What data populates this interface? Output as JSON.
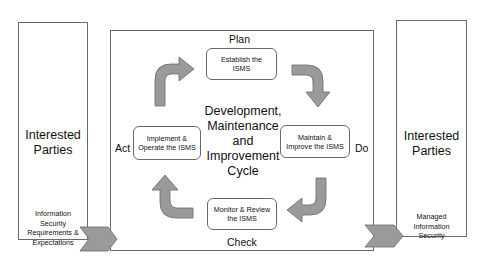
{
  "diagram": {
    "type": "cycle",
    "title": "Development, Maintenance and Improvement Cycle",
    "left_panel": {
      "title_line1": "Interested",
      "title_line2": "Parties",
      "input_line1": "Information",
      "input_line2": "Security",
      "input_line3": "Requirements &",
      "input_line4": "Expectations"
    },
    "right_panel": {
      "title_line1": "Interested",
      "title_line2": "Parties",
      "output_line1": "Managed",
      "output_line2": "Information",
      "output_line3": "Security"
    },
    "center": {
      "line1": "Development,",
      "line2": "Maintenance",
      "line3": "and",
      "line4": "Improvement",
      "line5": "Cycle"
    },
    "phases": {
      "plan": {
        "label": "Plan",
        "step_line1": "Establish the",
        "step_line2": "ISMS"
      },
      "do": {
        "label": "Do",
        "step_line1": "Maintain &",
        "step_line2": "Improve the ISMS"
      },
      "check": {
        "label": "Check",
        "step_line1": "Monitor & Review",
        "step_line2": "the ISMS"
      },
      "act": {
        "label": "Act",
        "step_line1": "Implement &",
        "step_line2": "Operate the ISMS"
      }
    },
    "colors": {
      "arrow_fill": "#9a9a9a",
      "arrow_stroke": "#6a6a6a",
      "border": "#6a6a6a"
    }
  }
}
